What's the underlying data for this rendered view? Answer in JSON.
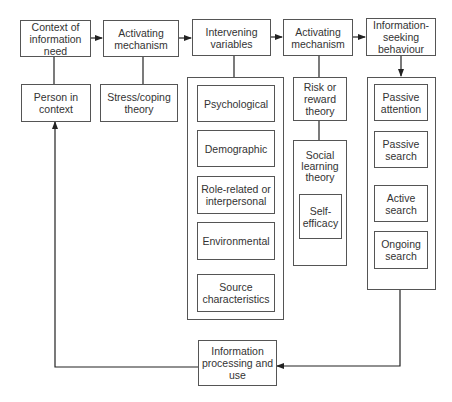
{
  "diagram": {
    "row1": [
      {
        "id": "context",
        "label": "Context of\ninformation\nneed"
      },
      {
        "id": "activating1",
        "label": "Activating\nmechanism"
      },
      {
        "id": "intervening",
        "label": "Intervening\nvariables"
      },
      {
        "id": "activating2",
        "label": "Activating\nmechanism"
      },
      {
        "id": "info_seeking",
        "label": "Information-\nseeking\nbehaviour"
      }
    ],
    "person_in_context": "Person in\ncontext",
    "stress_coping": "Stress/coping\ntheory",
    "intervening_variables": [
      "Psychological",
      "Demographic",
      "Role-related or\ninterpersonal",
      "Environmental",
      "Source\ncharacteristics"
    ],
    "risk_reward": "Risk or\nreward\ntheory",
    "social_learning": "Social\nlearning\ntheory",
    "self_efficacy": "Self-\nefficacy",
    "info_seeking_types": [
      "Passive\nattention",
      "Passive\nsearch",
      "Active\nsearch",
      "Ongoing\nsearch"
    ],
    "info_processing": "Information\nprocessing and\nuse",
    "colors": {
      "line": "#222222",
      "border": "#555555",
      "text": "#333333"
    }
  }
}
